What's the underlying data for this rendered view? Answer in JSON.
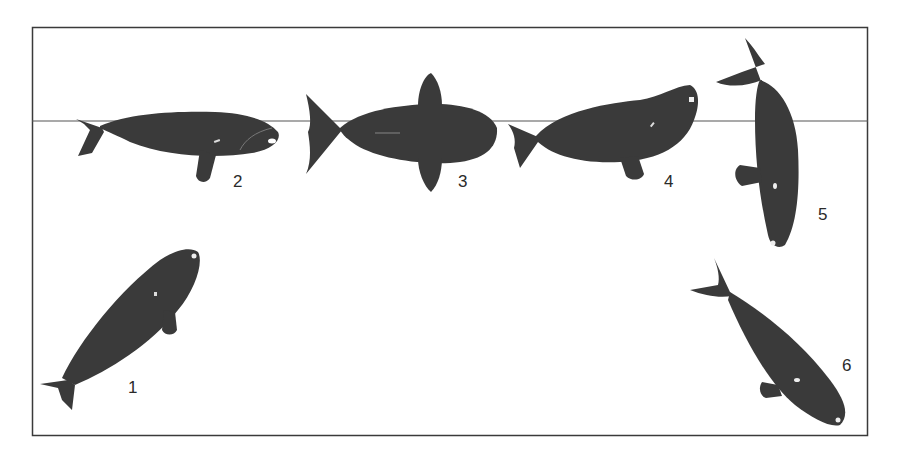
{
  "figure": {
    "frame": {
      "x": 32,
      "y": 27,
      "width": 836,
      "height": 409,
      "stroke": "#3a3a3a"
    },
    "waterline": {
      "y": 121,
      "stroke": "#555555"
    },
    "whale_color": "#3a3a3a",
    "whales": [
      {
        "id": 1,
        "label": "1",
        "label_x": 128,
        "label_y": 378,
        "posture": "ascending diagonally, head up"
      },
      {
        "id": 2,
        "label": "2",
        "label_x": 233,
        "label_y": 172,
        "posture": "horizontal at surface, facing right"
      },
      {
        "id": 3,
        "label": "3",
        "label_x": 458,
        "label_y": 172,
        "posture": "dorsal view at surface"
      },
      {
        "id": 4,
        "label": "4",
        "label_x": 664,
        "label_y": 172,
        "posture": "head raising, arching"
      },
      {
        "id": 5,
        "label": "5",
        "label_x": 818,
        "label_y": 205,
        "posture": "vertical dive, head down, flukes up"
      },
      {
        "id": 6,
        "label": "6",
        "label_x": 842,
        "label_y": 356,
        "posture": "descending diagonally, head down"
      }
    ]
  }
}
